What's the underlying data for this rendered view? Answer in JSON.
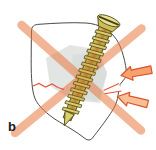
{
  "figure": {
    "label": "b",
    "alt": "Crossed-out medical illustration: fully threaded screw across a bone fragment with arrows pointing at an opening fracture gap"
  },
  "icons": [
    {
      "name": "x-cross-overlay"
    },
    {
      "name": "bone-screw-illustration"
    },
    {
      "name": "fracture-gap-arrow-top"
    },
    {
      "name": "fracture-gap-arrow-bottom"
    }
  ],
  "colors": {
    "background": "#FFFFFF",
    "bone_outline": "#4B4B49",
    "bone_fill": "#FFFFFF",
    "bone_shading": "#E2E5E2",
    "bone_shading_dark": "#D7DBD8",
    "x_overlay": "#E87840",
    "x_overlay_opacity": "0.55",
    "fracture_line": "#E2553A",
    "arrow_fill": "#F5A26E",
    "arrow_fill_pale": "#F7C096",
    "arrow_outline": "#DF5227",
    "screw_dark": "#4A430F",
    "screw_thread": "#D9CF6E",
    "screw_head_top": "#E9E09A",
    "screw_head_side": "#C9BE58",
    "label_color": "#1A1A1A"
  }
}
